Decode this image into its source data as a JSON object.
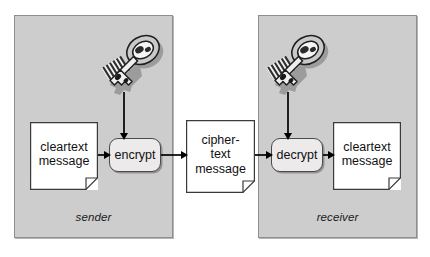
{
  "diagram": {
    "background_color": "#ffffff",
    "panel_color": "#cdcdcd",
    "panel_border_color": "#8e8e8e",
    "process_fill_color": "#eceaea",
    "arrow_color": "#000000",
    "document_fill_color": "#ffffff"
  },
  "panels": [
    {
      "id": "sender",
      "label": "sender"
    },
    {
      "id": "receiver",
      "label": "receiver"
    }
  ],
  "nodes": {
    "cleartext_sender": {
      "label": "cleartext\nmessage",
      "shape": "document",
      "icon": "document-icon"
    },
    "encrypt": {
      "label": "encrypt",
      "shape": "rounded-rect"
    },
    "ciphertext": {
      "label": "cipher-\ntext\nmessage",
      "shape": "document",
      "icon": "document-icon"
    },
    "decrypt": {
      "label": "decrypt",
      "shape": "rounded-rect"
    },
    "cleartext_receiver": {
      "label": "cleartext\nmessage",
      "shape": "document",
      "icon": "document-icon"
    }
  },
  "icons": {
    "key_sender": "key-icon",
    "key_receiver": "key-icon"
  },
  "arrows": [
    {
      "id": "cleartext-to-encrypt",
      "from": "cleartext_sender",
      "to": "encrypt",
      "direction": "right"
    },
    {
      "id": "encrypt-to-ciphertext",
      "from": "encrypt",
      "to": "ciphertext",
      "direction": "right"
    },
    {
      "id": "ciphertext-to-decrypt",
      "from": "ciphertext",
      "to": "decrypt",
      "direction": "right"
    },
    {
      "id": "decrypt-to-cleartext",
      "from": "decrypt",
      "to": "cleartext_receiver",
      "direction": "right"
    },
    {
      "id": "key-to-encrypt",
      "from": "key_sender",
      "to": "encrypt",
      "direction": "down"
    },
    {
      "id": "key-to-decrypt",
      "from": "key_receiver",
      "to": "decrypt",
      "direction": "down"
    }
  ]
}
